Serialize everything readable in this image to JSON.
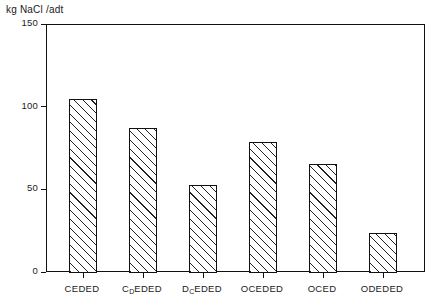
{
  "chart_data": {
    "type": "bar",
    "title": "",
    "ylabel": "kg NaCl /adt",
    "xlabel": "",
    "categories": [
      "CEDED",
      "C_DEDED",
      "D_CEDED",
      "OCEDED",
      "OCED",
      "ODEDED"
    ],
    "category_labels": [
      {
        "main": "CEDED",
        "sub_index": null,
        "sub": "",
        "tail": ""
      },
      {
        "main": "C",
        "sub_index": 1,
        "sub": "D",
        "tail": "EDED"
      },
      {
        "main": "D",
        "sub_index": 1,
        "sub": "C",
        "tail": "EDED"
      },
      {
        "main": "OCEDED",
        "sub_index": null,
        "sub": "",
        "tail": ""
      },
      {
        "main": "OCED",
        "sub_index": null,
        "sub": "",
        "tail": ""
      },
      {
        "main": "ODEDED",
        "sub_index": null,
        "sub": "",
        "tail": ""
      }
    ],
    "values": [
      105,
      88,
      53,
      79,
      66,
      24
    ],
    "ylim": [
      0,
      150
    ],
    "yticks": [
      0,
      50,
      100,
      150
    ],
    "ytick_labels": [
      "0",
      "50",
      "100",
      "150"
    ],
    "grid": false,
    "legend": null,
    "bar_style": "diagonal-hatch",
    "colors": {
      "axis": "#111111",
      "bar_edge": "#111111",
      "bar_fill": "#ffffff",
      "hatch": "#222222",
      "background": "#ffffff"
    }
  }
}
